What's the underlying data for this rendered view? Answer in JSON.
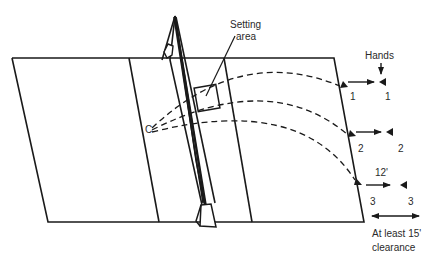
{
  "diagram": {
    "labels": {
      "setting_area_line1": "Setting",
      "setting_area_line2": "area",
      "hands": "Hands",
      "catcher": "C",
      "distance_12": "12'",
      "clearance_line1": "At least 15'",
      "clearance_line2": "clearance"
    },
    "positions": [
      {
        "id": "1",
        "left_label": "1",
        "right_label": "1"
      },
      {
        "id": "2",
        "left_label": "2",
        "right_label": "2"
      },
      {
        "id": "3",
        "left_label": "3",
        "right_label": "3"
      }
    ],
    "colors": {
      "line": "#1a1a1a",
      "background": "#ffffff"
    }
  }
}
